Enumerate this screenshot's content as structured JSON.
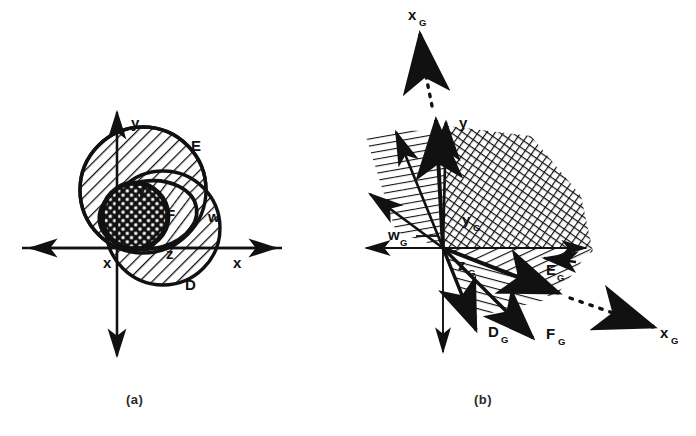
{
  "figure": {
    "type": "two-panel-geometric-diagram",
    "width": 696,
    "height": 436,
    "background": "#ffffff",
    "ink": "#111111"
  },
  "panels": [
    {
      "id": "a",
      "caption": "(a)",
      "description": "Cartesian axes with two overlapping hatched circles E and D, an inner cross-hatched ellipse F, and labelled points x, y, z, w",
      "axes": {
        "x_left_label": "x",
        "x_right_label": "x",
        "y_up_label": "y",
        "y_down_label": ""
      },
      "regions": [
        {
          "name": "E",
          "label": "E",
          "shape": "circle",
          "fill": "diagonal-hatch"
        },
        {
          "name": "D",
          "label": "D",
          "shape": "circle",
          "fill": "diagonal-hatch"
        },
        {
          "name": "F",
          "label": "F",
          "shape": "ellipse",
          "fill": "cross-hatch"
        }
      ],
      "point_labels": [
        "x",
        "y",
        "z",
        "w"
      ]
    },
    {
      "id": "b",
      "caption": "(b)",
      "description": "Dual / gradient cone representation with hatched wedges and directed arrows",
      "axes": {
        "x_left_label": "",
        "x_right_label": "x",
        "y_up_label": "y",
        "xg_top_label": "x",
        "xg_top_sub": "G",
        "xg_bottom_label": "x",
        "xg_bottom_sub": "G"
      },
      "cone_labels": [
        {
          "base": "w",
          "sub": "G"
        },
        {
          "base": "y",
          "sub": "G"
        },
        {
          "base": "z",
          "sub": "G"
        },
        {
          "base": "D",
          "sub": "G"
        },
        {
          "base": "F",
          "sub": "G"
        },
        {
          "base": "E",
          "sub": "G"
        }
      ]
    }
  ]
}
